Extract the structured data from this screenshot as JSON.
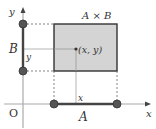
{
  "diagram": {
    "labels": {
      "y_axis": "y",
      "x_axis": "x",
      "origin": "O",
      "set_a": "A",
      "set_b": "B",
      "product": "A × B",
      "point": "(x, y)",
      "x_coord": "x",
      "y_coord": "y"
    },
    "colors": {
      "rect_fill": "#d4d4d4",
      "rect_stroke": "#333333",
      "axis": "#aaaaaa",
      "segment": "#444444",
      "dot": "#555555",
      "dashed": "#666666",
      "guide": "#b5b5b5"
    }
  }
}
